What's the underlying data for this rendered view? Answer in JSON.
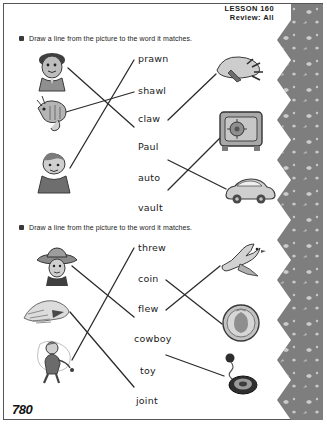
{
  "header": {
    "lesson_label": "LESSON 160",
    "review_label": "Review: All"
  },
  "page_number": "780",
  "exercises": [
    {
      "id": "exercise-1",
      "bullet": "square-bullet",
      "instruction": "Draw a line from the picture to the word it matches.",
      "words": [
        "prawn",
        "shawl",
        "claw",
        "Paul",
        "auto",
        "vault"
      ],
      "left_pictures": [
        {
          "name": "boy-face-picture",
          "label": "boy face"
        },
        {
          "name": "prawn-picture",
          "label": "prawn"
        },
        {
          "name": "child-shawl-picture",
          "label": "child wearing shawl"
        }
      ],
      "right_pictures": [
        {
          "name": "claw-picture",
          "label": "claw"
        },
        {
          "name": "vault-picture",
          "label": "vault safe"
        },
        {
          "name": "auto-car-picture",
          "label": "car"
        }
      ],
      "matches": [
        {
          "from": "boy-face-picture",
          "to": "Paul"
        },
        {
          "from": "prawn-picture",
          "to": "shawl"
        },
        {
          "from": "child-shawl-picture",
          "to": "prawn"
        },
        {
          "from": "claw",
          "to": "claw-picture"
        },
        {
          "from": "auto",
          "to": "auto-car-picture"
        },
        {
          "from": "vault",
          "to": "vault-picture"
        }
      ]
    },
    {
      "id": "exercise-2",
      "bullet": "square-bullet",
      "instruction": "Draw a line from the picture to the word it matches.",
      "words": [
        "threw",
        "coin",
        "flew",
        "cowboy",
        "toy",
        "joint"
      ],
      "left_pictures": [
        {
          "name": "cowboy-picture",
          "label": "cowboy"
        },
        {
          "name": "hand-joint-picture",
          "label": "hand"
        },
        {
          "name": "thrower-picture",
          "label": "person throwing"
        }
      ],
      "right_pictures": [
        {
          "name": "bird-flew-picture",
          "label": "flying bird"
        },
        {
          "name": "coin-picture",
          "label": "coin"
        },
        {
          "name": "yoyo-toy-picture",
          "label": "yo-yo toy"
        }
      ],
      "matches": [
        {
          "from": "cowboy-picture",
          "to": "cowboy"
        },
        {
          "from": "hand-joint-picture",
          "to": "joint"
        },
        {
          "from": "thrower-picture",
          "to": "threw"
        },
        {
          "from": "coin",
          "to": "coin-picture"
        },
        {
          "from": "flew",
          "to": "bird-flew-picture"
        },
        {
          "from": "toy",
          "to": "yoyo-toy-picture"
        }
      ]
    }
  ],
  "colors": {
    "band": "#7e7e7e",
    "ink": "#1b1b1b",
    "line": "#2b2b2b",
    "art_light": "#c9c9c9",
    "art_mid": "#9a9a9a",
    "art_dark": "#4a4a4a"
  }
}
